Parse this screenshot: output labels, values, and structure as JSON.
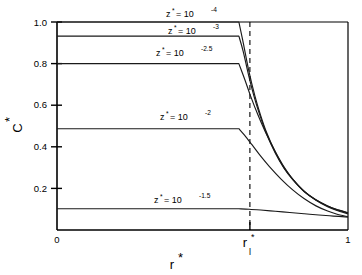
{
  "figure": {
    "background_color": "#ffffff",
    "line_color": "#1a1a1a",
    "axis_color": "#000000"
  },
  "axes": {
    "y_title_base": "C",
    "y_title_sup": "*",
    "x_title_base": "r",
    "x_title_sup": "*",
    "y_ticks": [
      "0.2",
      "0.4",
      "0.6",
      "0.8",
      "1.0"
    ],
    "x_tick_left": "0",
    "x_tick_right": "1",
    "x_tick_mid_base": "r",
    "x_tick_mid_sup": "*",
    "x_tick_mid_sub": "l"
  },
  "series_labels": [
    {
      "prefix": "z",
      "star": "*",
      "equals": "=  10",
      "exponent": "-4"
    },
    {
      "prefix": "z",
      "star": "*",
      "equals": "=  10",
      "exponent": "-3"
    },
    {
      "prefix": "z",
      "star": "*",
      "equals": "=  10",
      "exponent": "-2.5"
    },
    {
      "prefix": "z",
      "star": "*",
      "equals": "=  10",
      "exponent": "-2"
    },
    {
      "prefix": "z",
      "star": "*",
      "equals": "=  10",
      "exponent": "-1.5"
    }
  ],
  "chart_data": {
    "type": "line",
    "title": "",
    "xlabel": "r*",
    "ylabel": "C*",
    "xlim": [
      0,
      1
    ],
    "ylim": [
      0,
      1
    ],
    "grid": false,
    "legend_position": "inline-annotations",
    "r_l": 0.625,
    "x_ticks": [
      0,
      0.625,
      1
    ],
    "x_tick_labels": [
      "0",
      "r*_l",
      "1"
    ],
    "y_ticks": [
      0.2,
      0.4,
      0.6,
      0.8,
      1.0
    ],
    "y_tick_labels": [
      "0.2",
      "0.4",
      "0.6",
      "0.8",
      "1.0"
    ],
    "series": [
      {
        "name": "z* = 10^-4",
        "plateau": 1.0,
        "x": [
          0.0,
          0.625,
          0.64,
          0.66,
          0.68,
          0.7,
          0.72,
          0.75,
          0.78,
          0.81,
          0.85,
          0.89,
          0.93,
          0.96,
          1.0
        ],
        "values": [
          1.0,
          1.0,
          0.9,
          0.76,
          0.645,
          0.55,
          0.47,
          0.375,
          0.3,
          0.245,
          0.185,
          0.145,
          0.115,
          0.098,
          0.082
        ]
      },
      {
        "name": "z* = 10^-3",
        "plateau": 0.932,
        "x": [
          0.0,
          0.625,
          0.64,
          0.66,
          0.68,
          0.7,
          0.72,
          0.75,
          0.78,
          0.81,
          0.85,
          0.89,
          0.93,
          0.96,
          1.0
        ],
        "values": [
          0.932,
          0.932,
          0.858,
          0.735,
          0.628,
          0.54,
          0.463,
          0.37,
          0.297,
          0.242,
          0.184,
          0.144,
          0.115,
          0.099,
          0.084
        ]
      },
      {
        "name": "z* = 10^-2.5",
        "plateau": 0.8,
        "x": [
          0.0,
          0.625,
          0.645,
          0.665,
          0.69,
          0.715,
          0.745,
          0.775,
          0.81,
          0.85,
          0.89,
          0.93,
          0.96,
          1.0
        ],
        "values": [
          0.8,
          0.8,
          0.725,
          0.645,
          0.555,
          0.475,
          0.39,
          0.315,
          0.245,
          0.186,
          0.143,
          0.112,
          0.095,
          0.078
        ]
      },
      {
        "name": "z* = 10^-2",
        "plateau": 0.487,
        "x": [
          0.0,
          0.625,
          0.645,
          0.67,
          0.7,
          0.73,
          0.77,
          0.81,
          0.85,
          0.89,
          0.93,
          0.96,
          1.0
        ],
        "values": [
          0.487,
          0.487,
          0.455,
          0.41,
          0.355,
          0.305,
          0.245,
          0.193,
          0.15,
          0.116,
          0.091,
          0.077,
          0.064
        ]
      },
      {
        "name": "z* = 10^-1.5",
        "plateau": 0.102,
        "x": [
          0.0,
          0.625,
          0.66,
          0.7,
          0.75,
          0.8,
          0.85,
          0.9,
          0.95,
          1.0
        ],
        "values": [
          0.102,
          0.102,
          0.1,
          0.096,
          0.09,
          0.084,
          0.078,
          0.072,
          0.067,
          0.062
        ]
      }
    ]
  }
}
